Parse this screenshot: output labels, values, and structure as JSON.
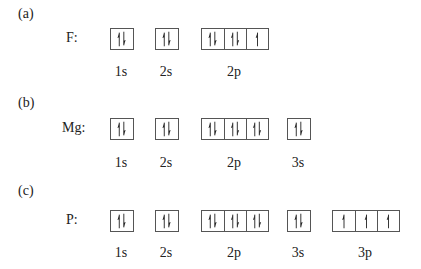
{
  "diagrams": [
    {
      "part": "(a)",
      "element": "F:",
      "orbitals": [
        {
          "name": "1s",
          "electrons": [
            [
              "up",
              "down"
            ]
          ]
        },
        {
          "name": "2s",
          "electrons": [
            [
              "up",
              "down"
            ]
          ]
        },
        {
          "name": "2p",
          "electrons": [
            [
              "up",
              "down"
            ],
            [
              "up",
              "down"
            ],
            [
              "up"
            ]
          ]
        }
      ]
    },
    {
      "part": "(b)",
      "element": "Mg:",
      "orbitals": [
        {
          "name": "1s",
          "electrons": [
            [
              "up",
              "down"
            ]
          ]
        },
        {
          "name": "2s",
          "electrons": [
            [
              "up",
              "down"
            ]
          ]
        },
        {
          "name": "2p",
          "electrons": [
            [
              "up",
              "down"
            ],
            [
              "up",
              "down"
            ],
            [
              "up",
              "down"
            ]
          ]
        },
        {
          "name": "3s",
          "electrons": [
            [
              "up",
              "down"
            ]
          ]
        }
      ]
    },
    {
      "part": "(c)",
      "element": "P:",
      "orbitals": [
        {
          "name": "1s",
          "electrons": [
            [
              "up",
              "down"
            ]
          ]
        },
        {
          "name": "2s",
          "electrons": [
            [
              "up",
              "down"
            ]
          ]
        },
        {
          "name": "2p",
          "electrons": [
            [
              "up",
              "down"
            ],
            [
              "up",
              "down"
            ],
            [
              "up",
              "down"
            ]
          ]
        },
        {
          "name": "3s",
          "electrons": [
            [
              "up",
              "down"
            ]
          ]
        },
        {
          "name": "3p",
          "electrons": [
            [
              "up"
            ],
            [
              "up"
            ],
            [
              "up"
            ]
          ]
        }
      ]
    }
  ]
}
